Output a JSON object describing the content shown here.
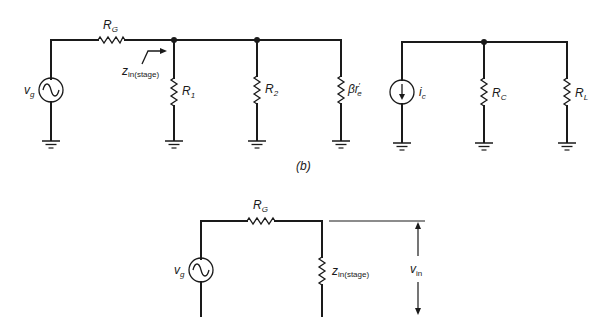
{
  "figure_label": "(b)",
  "circuit_input_ac": {
    "source": {
      "symbol": "v",
      "sub": "g"
    },
    "series_resistor": {
      "symbol": "R",
      "sub": "G"
    },
    "impedance_arrow": {
      "symbol": "z",
      "sub": "in(stage)"
    },
    "shunt_resistors": [
      {
        "symbol": "R",
        "sub": "1"
      },
      {
        "symbol": "R",
        "sub": "2"
      },
      {
        "symbol": "βr",
        "sub": "e",
        "prime": "′"
      }
    ]
  },
  "circuit_output_ac": {
    "source": {
      "symbol": "i",
      "sub": "c"
    },
    "shunt_resistors": [
      {
        "symbol": "R",
        "sub": "C"
      },
      {
        "symbol": "R",
        "sub": "L"
      }
    ]
  },
  "circuit_equivalent": {
    "source": {
      "symbol": "v",
      "sub": "g"
    },
    "series_resistor": {
      "symbol": "R",
      "sub": "G"
    },
    "load": {
      "symbol": "z",
      "sub": "in(stage)"
    },
    "voltage": {
      "symbol": "v",
      "sub": "in"
    }
  }
}
